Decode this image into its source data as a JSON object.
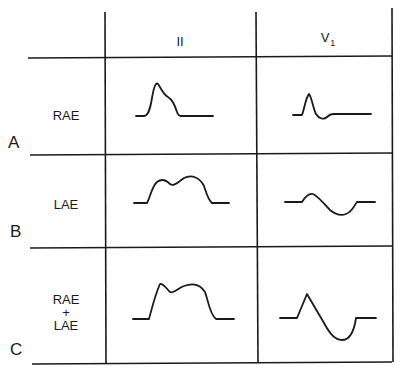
{
  "columns": [
    {
      "label": "II",
      "sub": ""
    },
    {
      "label": "V",
      "sub": "1"
    }
  ],
  "rows": [
    {
      "letter": "A",
      "label_lines": [
        "RAE"
      ],
      "label": "RAE"
    },
    {
      "letter": "B",
      "label_lines": [
        "LAE"
      ],
      "label": "LAE"
    },
    {
      "letter": "C",
      "label_lines": [
        "RAE",
        "+",
        "LAE"
      ],
      "label": "RAE + LAE"
    }
  ],
  "waveforms": {
    "A_II": "Tall peaked P wave with late shoulder",
    "A_V1": "Sharp positive P with small negative trough",
    "B_II": "Broad notched (M-shaped) P wave",
    "B_V1": "Biphasic P with deep broad negative component",
    "C_II": "Tall, broad notched P wave",
    "C_V1": "Tall positive then deep broad negative P"
  },
  "colors": {
    "line": "#1a1a1a",
    "background": "#ffffff"
  }
}
